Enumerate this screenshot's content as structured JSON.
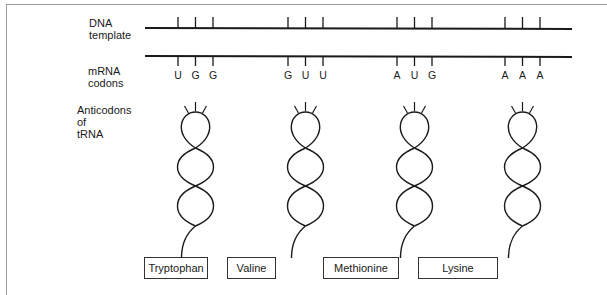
{
  "labels": {
    "dna_template": "DNA\ntemplate",
    "mrna_codons": "mRNA\ncodons",
    "anticodons": "Anticodons\nof\ntRNA"
  },
  "codons": [
    {
      "bases": [
        "U",
        "G",
        "G"
      ],
      "amino_acid": "Tryptophan"
    },
    {
      "bases": [
        "G",
        "U",
        "U"
      ],
      "amino_acid": "Valine"
    },
    {
      "bases": [
        "A",
        "U",
        "G"
      ],
      "amino_acid": "Methionine"
    },
    {
      "bases": [
        "A",
        "A",
        "A"
      ],
      "amino_acid": "Lysine"
    }
  ],
  "colors": {
    "stroke": "#1a1a1a",
    "frame": "#9a9a9a"
  }
}
